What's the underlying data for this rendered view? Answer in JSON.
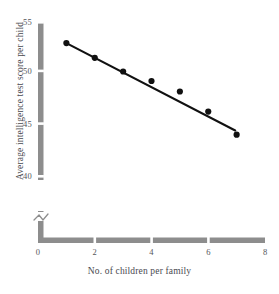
{
  "chart_data": {
    "type": "scatter",
    "title": "",
    "xlabel": "No. of children per family",
    "ylabel": "Average intelligence test score per child",
    "xlim": [
      0,
      8
    ],
    "ylim": [
      38.5,
      55
    ],
    "grid": false,
    "legend": "none",
    "axis_break": true,
    "axis_break_note": "y-axis broken below 40",
    "x_ticks": [
      "0",
      "2",
      "4",
      "6",
      "8"
    ],
    "x_tick_values": [
      0,
      2,
      4,
      6,
      8
    ],
    "y_ticks": [
      "40",
      "45",
      "50",
      "55"
    ],
    "y_tick_values": [
      40,
      45,
      50,
      55
    ],
    "x": [
      1,
      2,
      3,
      4,
      5,
      6,
      7
    ],
    "values": [
      53.0,
      51.6,
      50.3,
      49.4,
      48.4,
      46.5,
      44.3
    ],
    "points": [
      {
        "x": 1,
        "y": 53.0
      },
      {
        "x": 2,
        "y": 51.6
      },
      {
        "x": 3,
        "y": 50.3
      },
      {
        "x": 4,
        "y": 49.4
      },
      {
        "x": 5,
        "y": 48.4
      },
      {
        "x": 6,
        "y": 46.5
      },
      {
        "x": 7,
        "y": 44.3
      }
    ],
    "trendline": {
      "type": "linear-fit",
      "x_start": 1,
      "y_start": 53.0,
      "x_end": 6.95,
      "y_end": 44.7
    },
    "colors": {
      "marker": "#111111",
      "trendline": "#111111",
      "axis": "#8d8d8d",
      "text": "#4a4a50",
      "background": "#ffffff"
    }
  }
}
